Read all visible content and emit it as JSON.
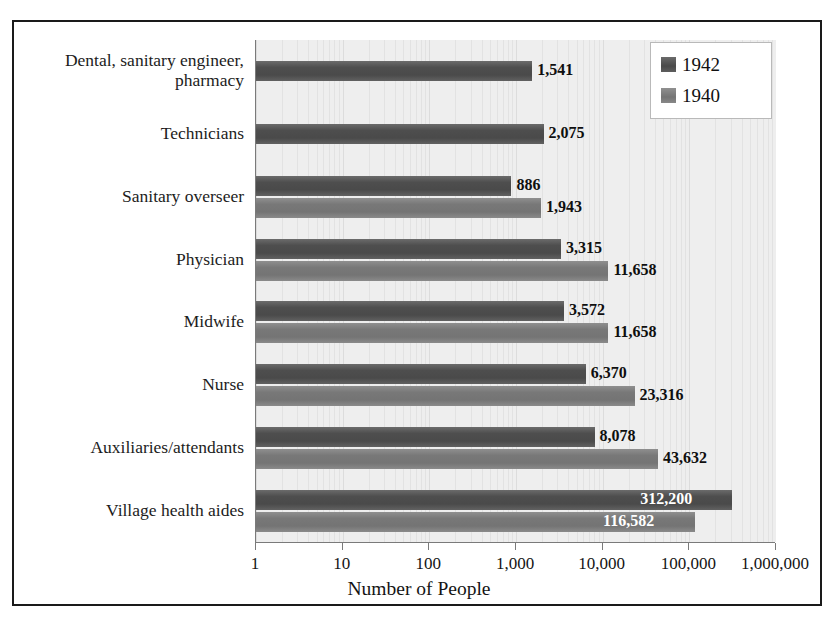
{
  "chart_data": {
    "type": "bar",
    "orientation": "horizontal",
    "title": "",
    "xlabel": "Number of People",
    "ylabel": "",
    "xscale": "log",
    "xlim": [
      1,
      1000000
    ],
    "grid": true,
    "legend_position": "top-right",
    "tick_labels": [
      "1",
      "10",
      "100",
      "1,000",
      "10,000",
      "100,000",
      "1,000,000"
    ],
    "tick_values": [
      1,
      10,
      100,
      1000,
      10000,
      100000,
      1000000
    ],
    "categories": [
      "Dental, sanitary engineer,\npharmacy",
      "Technicians",
      "Sanitary overseer",
      "Physician",
      "Midwife",
      "Nurse",
      "Auxiliaries/attendants",
      "Village health aides"
    ],
    "series": [
      {
        "name": "1942",
        "color": "#4a4a4a",
        "values": [
          1541,
          2075,
          886,
          3315,
          3572,
          6370,
          8078,
          312200
        ],
        "labels": [
          "1,541",
          "2,075",
          "886",
          "3,315",
          "3,572",
          "6,370",
          "8,078",
          "312,200"
        ]
      },
      {
        "name": "1940",
        "color": "#747474",
        "values": [
          null,
          null,
          1943,
          11658,
          11658,
          23316,
          43632,
          116582
        ],
        "labels": [
          "",
          "",
          "1,943",
          "11,658",
          "11,658",
          "23,316",
          "43,632",
          "116,582"
        ]
      }
    ]
  },
  "legend": {
    "entries": [
      {
        "label": "1942"
      },
      {
        "label": "1940"
      }
    ]
  },
  "axis": {
    "x_title": "Number of People"
  }
}
